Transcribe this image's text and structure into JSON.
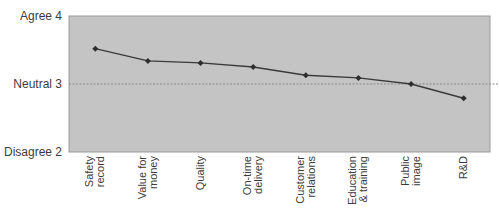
{
  "chart_data": {
    "type": "line",
    "title": "",
    "xlabel": "",
    "ylabel": "",
    "categories": [
      "Safety record",
      "Value for money",
      "Quality",
      "On-time delivery",
      "Customer relations",
      "Education & training",
      "Public image",
      "R&D"
    ],
    "category_label_lines": [
      [
        "Safety",
        "record"
      ],
      [
        "Value for",
        "money"
      ],
      [
        "Quality"
      ],
      [
        "On-time",
        "delivery"
      ],
      [
        "Customer",
        "relations"
      ],
      [
        "Education",
        "& training"
      ],
      [
        "Public",
        "image"
      ],
      [
        "R&D"
      ]
    ],
    "series": [
      {
        "name": "Rating",
        "values": [
          3.52,
          3.34,
          3.31,
          3.25,
          3.13,
          3.09,
          3.0,
          2.79
        ]
      }
    ],
    "ylim": [
      2,
      4
    ],
    "yticks": [
      {
        "value": 4,
        "label": "Agree 4"
      },
      {
        "value": 3,
        "label": "Neutral 3"
      },
      {
        "value": 2,
        "label": "Disagree 2"
      }
    ],
    "reference_line": {
      "value": 3,
      "style": "dotted"
    },
    "grid": false,
    "legend": "none",
    "colors": {
      "plot_background": "#c4c4c4",
      "line": "#3a3a3a",
      "marker": "#2e2e2e",
      "reference_line": "#8a8a8a"
    }
  }
}
